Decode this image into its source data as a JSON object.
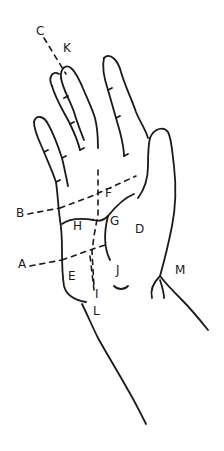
{
  "figure": {
    "stroke_color": "#1a1a1a",
    "background": "#ffffff",
    "labels": [
      {
        "id": "A",
        "text": "A",
        "x": 18,
        "y": 262
      },
      {
        "id": "B",
        "text": "B",
        "x": 16,
        "y": 211
      },
      {
        "id": "C",
        "text": "C",
        "x": 36,
        "y": 28
      },
      {
        "id": "D",
        "text": "D",
        "x": 135,
        "y": 225
      },
      {
        "id": "E",
        "text": "E",
        "x": 68,
        "y": 272
      },
      {
        "id": "F",
        "text": "F",
        "x": 106,
        "y": 189
      },
      {
        "id": "G",
        "text": "G",
        "x": 110,
        "y": 217
      },
      {
        "id": "H",
        "text": "H",
        "x": 73,
        "y": 221
      },
      {
        "id": "I",
        "text": "I",
        "x": 95,
        "y": 290
      },
      {
        "id": "J",
        "text": "J",
        "x": 116,
        "y": 266
      },
      {
        "id": "K",
        "text": "K",
        "x": 64,
        "y": 44
      },
      {
        "id": "L",
        "text": "L",
        "x": 93,
        "y": 306
      },
      {
        "id": "M",
        "text": "M",
        "x": 175,
        "y": 266
      }
    ]
  }
}
